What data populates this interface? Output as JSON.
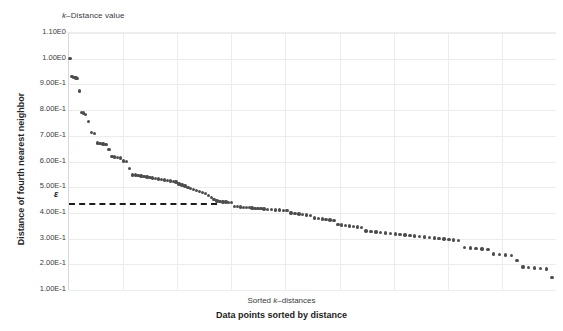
{
  "chart_data": {
    "type": "scatter",
    "xlabel": "Data points sorted by distance",
    "xlabel_secondary": "Sorted k-distances",
    "ylabel": "Distance of fourth nearest neighbor",
    "ylim": [
      0.1,
      1.1
    ],
    "xlim": [
      0,
      500
    ],
    "grid": true,
    "legend": "none",
    "marker_color": "#4d4d4d",
    "gridline_color": "#ececec",
    "background_color": "#ffffff",
    "ytick_labels": [
      "1.10E0",
      "1.00E0",
      "9.00E-1",
      "8.00E-1",
      "7.00E-1",
      "6.00E-1",
      "5.00E-1",
      "4.00E-1",
      "3.00E-1",
      "2.00E-1",
      "1.00E-1"
    ],
    "ytick_values": [
      1.1,
      1.0,
      0.9,
      0.8,
      0.7,
      0.6,
      0.5,
      0.4,
      0.3,
      0.2,
      0.1
    ],
    "xtick_labels": [],
    "n_vertical_gridlines": 8,
    "annotations": [
      {
        "name": "epsilon",
        "label": "ε",
        "type": "hline",
        "y": 0.44,
        "x_start": 0,
        "x_end": 152,
        "style": "dashed",
        "color": "#1c1c1c"
      }
    ],
    "x": [
      1,
      3,
      5,
      7,
      9,
      11,
      13,
      15,
      17,
      20,
      23,
      26,
      29,
      32,
      35,
      38,
      41,
      44,
      47,
      50,
      53,
      56,
      59,
      62,
      65,
      68,
      71,
      74,
      77,
      80,
      83,
      86,
      89,
      92,
      95,
      98,
      101,
      104,
      107,
      110,
      113,
      116,
      119,
      122,
      125,
      128,
      131,
      134,
      137,
      140,
      143,
      146,
      149,
      152,
      155,
      158,
      161,
      164,
      167,
      170,
      173,
      176,
      179,
      182,
      185,
      188,
      191,
      194,
      197,
      200,
      204,
      208,
      212,
      216,
      220,
      224,
      228,
      232,
      236,
      240,
      244,
      248,
      252,
      256,
      260,
      264,
      268,
      272,
      276,
      280,
      284,
      288,
      292,
      296,
      300,
      305,
      310,
      315,
      320,
      325,
      330,
      335,
      340,
      345,
      350,
      355,
      360,
      365,
      370,
      375,
      380,
      385,
      390,
      395,
      400,
      406,
      412,
      418,
      424,
      430,
      436,
      442,
      448,
      454,
      460,
      466,
      472,
      478,
      484,
      490,
      496
    ],
    "y": [
      1.0,
      0.93,
      0.928,
      0.925,
      0.922,
      0.875,
      0.79,
      0.788,
      0.783,
      0.755,
      0.712,
      0.708,
      0.672,
      0.67,
      0.668,
      0.665,
      0.646,
      0.62,
      0.618,
      0.615,
      0.613,
      0.602,
      0.6,
      0.572,
      0.548,
      0.547,
      0.545,
      0.543,
      0.541,
      0.54,
      0.538,
      0.536,
      0.534,
      0.532,
      0.53,
      0.528,
      0.526,
      0.524,
      0.522,
      0.52,
      0.512,
      0.508,
      0.505,
      0.5,
      0.496,
      0.492,
      0.488,
      0.484,
      0.48,
      0.476,
      0.468,
      0.46,
      0.452,
      0.446,
      0.444,
      0.443,
      0.442,
      0.441,
      0.44,
      0.425,
      0.424,
      0.423,
      0.422,
      0.421,
      0.42,
      0.419,
      0.418,
      0.417,
      0.416,
      0.415,
      0.414,
      0.413,
      0.412,
      0.411,
      0.41,
      0.409,
      0.4,
      0.398,
      0.396,
      0.394,
      0.392,
      0.39,
      0.38,
      0.378,
      0.376,
      0.374,
      0.372,
      0.37,
      0.355,
      0.353,
      0.351,
      0.349,
      0.347,
      0.345,
      0.343,
      0.33,
      0.328,
      0.326,
      0.324,
      0.322,
      0.32,
      0.318,
      0.316,
      0.314,
      0.312,
      0.31,
      0.308,
      0.306,
      0.304,
      0.302,
      0.3,
      0.298,
      0.296,
      0.294,
      0.292,
      0.265,
      0.263,
      0.261,
      0.259,
      0.257,
      0.24,
      0.238,
      0.236,
      0.234,
      0.215,
      0.19,
      0.188,
      0.186,
      0.184,
      0.182,
      0.148
    ]
  }
}
